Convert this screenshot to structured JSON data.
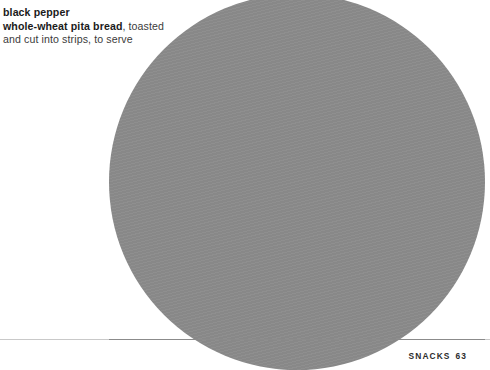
{
  "page": {
    "width": 490,
    "height": 370,
    "background_color": "#ffffff"
  },
  "ingredient_text": {
    "line1_bold": "black pepper",
    "line2_bold": "whole-wheat pita bread",
    "line2_regular": ", toasted",
    "line3_regular": "and cut into strips, to serve",
    "bold_color": "#1b1b1b",
    "regular_color": "#3b3b3b"
  },
  "photo": {
    "name": "recipe-photo-circle",
    "shape": "circle",
    "fill_color": "#8b8b8b"
  },
  "divider": {
    "name": "footer-rule",
    "color": "#c9c9c9"
  },
  "footer": {
    "section_label": "SNACKS",
    "page_number": "63",
    "color": "#2c2c2c"
  }
}
